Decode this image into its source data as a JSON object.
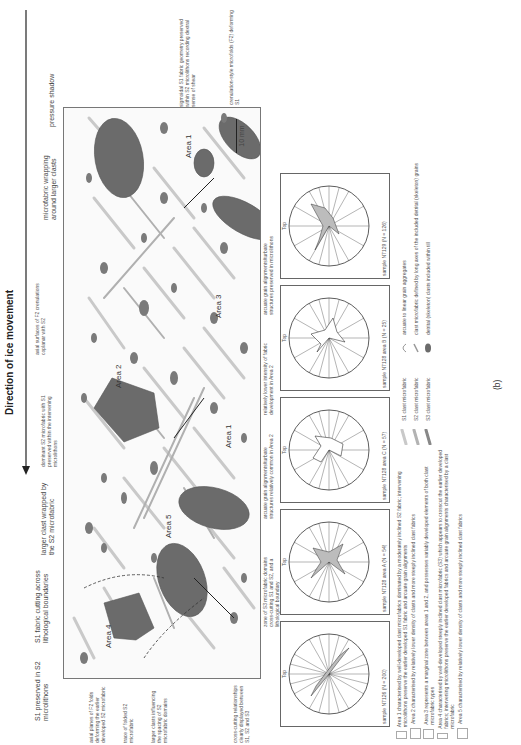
{
  "figure": {
    "panel_label": "(b)",
    "direction_label": "Direction of ice movement",
    "scale_bar": "10 mm",
    "area_labels": [
      "Area 1",
      "Area 1",
      "Area 2",
      "Area 3",
      "Area 4",
      "Area 5"
    ],
    "fabric_labels": [
      "S1",
      "S2",
      "S3"
    ],
    "annotations_top": [
      "S1 preserved in S2 microlithons",
      "S1 fabric cutting across lithological boundaries",
      "larger clast wrapped by the S2 microfabric",
      "dominant S2 microfabric with S1 preserved within the intervening microlithons",
      "axial surfaces of F2 crenulations coplanar with S2",
      "microfabric wrapping around larger clasts",
      "pressure shadow"
    ],
    "annotations_right": [
      "sigmoidal S1 fabric geometry preserved within S2 microlithons recording dextral sense of shear",
      "crenulation-style microfolds (F2) deforming S1"
    ],
    "annotations_left": [
      "axial planes of F2 folds deforming the earlier developed S2 microfabric",
      "trace of folded S2 microfabric",
      "larger clasts influencing the spacing of S2 microfabric domains",
      "cross-cutting relationships clearly displayed between S1, S2 and S3"
    ],
    "annotations_bottom": [
      "zone of S3 microfabric domains cross-cutting S1 and S2, and a lithological boundary",
      "arcuate grain alignments/turbate structures relatively common in Area 2",
      "relatively lower intensity of fabric development in Area 2",
      "arcuate grain alignments/turbate structures preserved in microlithons"
    ]
  },
  "rose_diagrams": [
    {
      "label": "sample N7126 (N = 200)",
      "top": "Top",
      "fabrics": [
        "S1",
        "S2"
      ]
    },
    {
      "label": "sample N7128 area A (N = 54)",
      "top": "Top",
      "fabrics": [
        "S1",
        "S2",
        "S3"
      ]
    },
    {
      "label": "sample N7128 area C (N = 57)",
      "top": "Top",
      "fabrics": [
        "S1",
        "S2"
      ]
    },
    {
      "label": "sample N7128 area B (N = 25)",
      "top": "Top",
      "fabrics": [
        "S1",
        "S2"
      ]
    },
    {
      "label": "sample N7129 (N = 126)",
      "top": "Top",
      "fabrics": [
        "S1",
        "S2"
      ]
    }
  ],
  "legend": {
    "areas": [
      "Area 1 characterised by well-developed clast microfabrics dominated by a moderately inclined S2 fabric; intervening microlithons preserve the earlier developed S1 fabric and arcuate grain alignments",
      "Area 2 characterised by relatively lower density of clasts and more steeply inclined clast fabrics",
      "Area 3 represents a marginal zone between areas 1 and 2, and possesses variably developed elements of both clast microfabric types",
      "Area 4 characterised by well-developed steeply inclined clast microfabric (S3) which appears to crosscut the earlier developed fabrics; intervening microlithons preserve the earlier developed fabrics and arcuate grain alignments characterised by a clast microfabric",
      "Area 5 characterised by relatively lower density of clasts and more steeply inclined clast fabrics"
    ],
    "symbols": [
      {
        "name": "S1 clast microfabric",
        "desc": "arcuate to linear grain aggregates"
      },
      {
        "name": "S2 clast microfabric",
        "desc": "clast microfabric defined by long axes of the included detrital (skeleton) grains"
      },
      {
        "name": "S3 clast microfabric",
        "desc": "detrital (skeleton) clasts included within till"
      }
    ]
  },
  "colors": {
    "clast": "#6b6b6b",
    "fabric_light": "#cfcfcf",
    "fabric_mid": "#b3b3b3",
    "frame": "#777777"
  }
}
